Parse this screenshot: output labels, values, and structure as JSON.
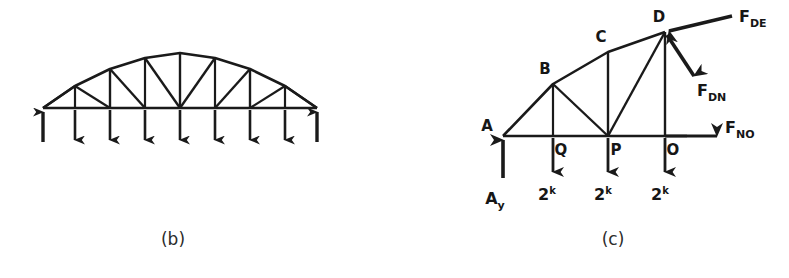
{
  "figure": {
    "background_color": "#ffffff",
    "ink_color": "#1a1a1a",
    "panels": [
      {
        "id": "b",
        "caption": "(b)",
        "description": "Arch truss free body diagram with upward end reactions and downward panel loads"
      },
      {
        "id": "c",
        "caption": "(c)",
        "description": "Sectioned partial truss free body diagram with member forces"
      }
    ]
  },
  "panel_b": {
    "caption": "(b)",
    "arrows": [
      {
        "name": "left-reaction",
        "direction": "up"
      },
      {
        "name": "load-1",
        "direction": "down"
      },
      {
        "name": "load-2",
        "direction": "down"
      },
      {
        "name": "load-3",
        "direction": "down"
      },
      {
        "name": "load-4",
        "direction": "down"
      },
      {
        "name": "load-5",
        "direction": "down"
      },
      {
        "name": "load-6",
        "direction": "down"
      },
      {
        "name": "load-7",
        "direction": "down"
      },
      {
        "name": "right-reaction",
        "direction": "up"
      }
    ]
  },
  "panel_c": {
    "caption": "(c)",
    "nodes": [
      {
        "label": "A",
        "x": 108,
        "y": 136
      },
      {
        "label": "B",
        "x": 158,
        "y": 84
      },
      {
        "label": "C",
        "x": 213,
        "y": 52
      },
      {
        "label": "D",
        "x": 270,
        "y": 32
      },
      {
        "label": "Q",
        "x": 158,
        "y": 136
      },
      {
        "label": "P",
        "x": 213,
        "y": 136
      },
      {
        "label": "O",
        "x": 270,
        "y": 136
      }
    ],
    "reaction": {
      "label": "A",
      "subscript": "y",
      "direction": "up"
    },
    "loads": [
      {
        "value": "2",
        "unit": "k",
        "at_node": "Q"
      },
      {
        "value": "2",
        "unit": "k",
        "at_node": "P"
      },
      {
        "value": "2",
        "unit": "k",
        "at_node": "O"
      }
    ],
    "member_forces": [
      {
        "label": "F",
        "subscript": "DE",
        "direction": "left",
        "at_node": "D"
      },
      {
        "label": "F",
        "subscript": "DN",
        "direction": "down-right",
        "at_node": "D"
      },
      {
        "label": "F",
        "subscript": "NO",
        "direction": "right",
        "at_node": "O"
      }
    ]
  }
}
